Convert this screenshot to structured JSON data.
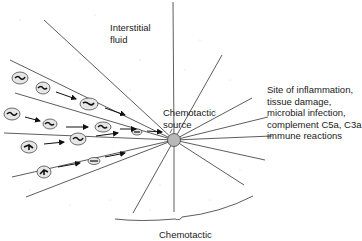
{
  "labels": {
    "interstitial": [
      "Interstitial",
      "fluid"
    ],
    "source": [
      "Chemotactic",
      "source"
    ],
    "site": [
      "Site of inflammation,",
      "tissue damage,",
      "microbial infection,",
      "complement C5a, C3a",
      "immune reactions"
    ],
    "bottom": "Chemotactic"
  },
  "colors": {
    "line": "#333333",
    "source_fill": "#b8b8b8",
    "cell_fill": "#e8e8e8",
    "dots": "#c8c8c8"
  },
  "source_center": [
    174,
    140
  ],
  "cells": [
    {
      "x": 18,
      "y": 75
    },
    {
      "x": 43,
      "y": 87
    },
    {
      "x": 88,
      "y": 102
    },
    {
      "x": 11,
      "y": 113
    },
    {
      "x": 48,
      "y": 123
    },
    {
      "x": 103,
      "y": 126
    },
    {
      "x": 28,
      "y": 146
    },
    {
      "x": 77,
      "y": 139
    },
    {
      "x": 136,
      "y": 132
    },
    {
      "x": 43,
      "y": 171
    },
    {
      "x": 93,
      "y": 161
    }
  ]
}
